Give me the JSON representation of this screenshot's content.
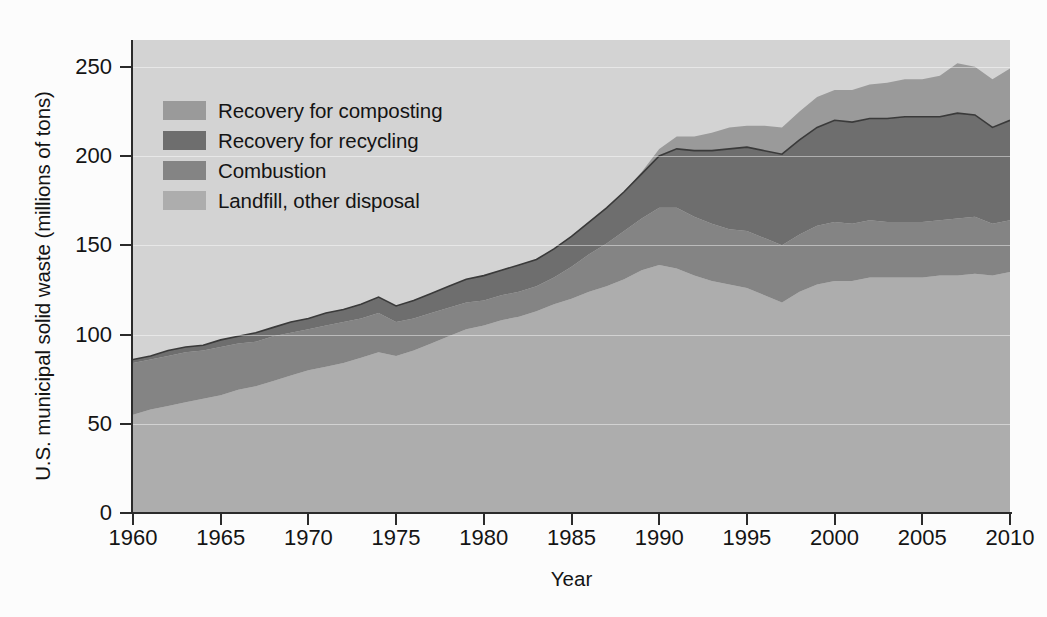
{
  "figure": {
    "background_color": "#fcfcfc",
    "plot_background_color": "#d3d3d3"
  },
  "axes": {
    "ylabel": "U.S. municipal solid waste (millions of tons)",
    "xlabel": "Year",
    "yticks": [
      "0",
      "50",
      "100",
      "150",
      "200",
      "250"
    ],
    "xticks": [
      "1960",
      "1965",
      "1970",
      "1975",
      "1980",
      "1985",
      "1990",
      "1995",
      "2000",
      "2005",
      "2010"
    ]
  },
  "legend": {
    "items": [
      {
        "label": "Recovery for composting",
        "color": "#9a9a9a"
      },
      {
        "label": "Recovery for recycling",
        "color": "#6e6e6e"
      },
      {
        "label": "Combustion",
        "color": "#848484"
      },
      {
        "label": "Landfill, other disposal",
        "color": "#adadad"
      }
    ]
  },
  "chart_data": {
    "type": "area",
    "stacked": true,
    "title": "",
    "xlabel": "Year",
    "ylabel": "U.S. municipal solid waste (millions of tons)",
    "xlim": [
      1960,
      2010
    ],
    "ylim": [
      0,
      265
    ],
    "yticks": [
      0,
      50,
      100,
      150,
      200,
      250
    ],
    "xticks": [
      1960,
      1965,
      1970,
      1975,
      1980,
      1985,
      1990,
      1995,
      2000,
      2005,
      2010
    ],
    "grid": false,
    "legend_position": "upper-left-inside",
    "x": [
      1960,
      1961,
      1962,
      1963,
      1964,
      1965,
      1966,
      1967,
      1968,
      1969,
      1970,
      1971,
      1972,
      1973,
      1974,
      1975,
      1976,
      1977,
      1978,
      1979,
      1980,
      1981,
      1982,
      1983,
      1984,
      1985,
      1986,
      1987,
      1988,
      1989,
      1990,
      1991,
      1992,
      1993,
      1994,
      1995,
      1996,
      1997,
      1998,
      1999,
      2000,
      2001,
      2002,
      2003,
      2004,
      2005,
      2006,
      2007,
      2008,
      2009,
      2010
    ],
    "series": [
      {
        "name": "Landfill, other disposal",
        "color": "#adadad",
        "values": [
          55,
          58,
          60,
          62,
          64,
          66,
          69,
          71,
          74,
          77,
          80,
          82,
          84,
          87,
          90,
          88,
          91,
          95,
          99,
          103,
          105,
          108,
          110,
          113,
          117,
          120,
          124,
          127,
          131,
          136,
          139,
          137,
          133,
          130,
          128,
          126,
          122,
          118,
          124,
          128,
          130,
          130,
          132,
          132,
          132,
          132,
          133,
          133,
          134,
          133,
          135
        ]
      },
      {
        "name": "Combustion",
        "color": "#848484",
        "values": [
          29,
          28,
          28,
          28,
          27,
          27,
          26,
          25,
          25,
          24,
          23,
          23,
          23,
          22,
          22,
          19,
          18,
          17,
          16,
          15,
          14,
          14,
          14,
          14,
          15,
          18,
          21,
          24,
          27,
          29,
          32,
          34,
          33,
          32,
          31,
          32,
          32,
          32,
          32,
          33,
          33,
          32,
          32,
          31,
          31,
          31,
          31,
          32,
          32,
          29,
          29
        ]
      },
      {
        "name": "Recovery for recycling",
        "color": "#6e6e6e",
        "values": [
          2,
          2,
          3,
          3,
          3,
          4,
          4,
          5,
          5,
          6,
          6,
          7,
          7,
          8,
          9,
          9,
          10,
          11,
          12,
          13,
          14,
          14,
          15,
          15,
          16,
          17,
          18,
          20,
          22,
          25,
          29,
          33,
          37,
          41,
          45,
          47,
          49,
          51,
          53,
          55,
          57,
          57,
          57,
          58,
          59,
          59,
          58,
          59,
          57,
          54,
          56
        ]
      },
      {
        "name": "Recovery for composting",
        "color": "#9a9a9a",
        "values": [
          0,
          0,
          0,
          0,
          0,
          0,
          0,
          0,
          0,
          0,
          0,
          0,
          0,
          0,
          0,
          0,
          0,
          0,
          0,
          0,
          0,
          0,
          0,
          0,
          0,
          0,
          0,
          0,
          0,
          1,
          4,
          7,
          8,
          10,
          12,
          12,
          14,
          15,
          16,
          17,
          17,
          18,
          19,
          20,
          21,
          21,
          23,
          28,
          27,
          27,
          29
        ]
      }
    ],
    "totals": [
      86,
      88,
      91,
      93,
      94,
      97,
      99,
      101,
      104,
      107,
      109,
      112,
      114,
      117,
      121,
      116,
      119,
      123,
      127,
      131,
      133,
      136,
      139,
      142,
      148,
      155,
      163,
      171,
      180,
      191,
      204,
      211,
      211,
      213,
      216,
      217,
      217,
      216,
      225,
      233,
      237,
      237,
      240,
      241,
      243,
      243,
      245,
      252,
      250,
      243,
      249
    ]
  }
}
